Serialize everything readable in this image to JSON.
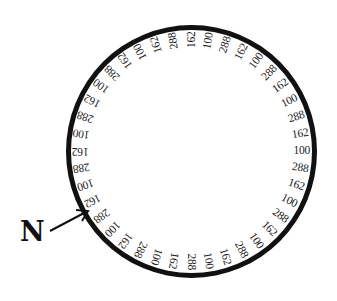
{
  "diagram": {
    "type": "circular-label-ring",
    "ring": {
      "center": [
        191,
        151
      ],
      "label_radius": 111,
      "start_angle_deg": -18,
      "step_deg": 9,
      "stroke_color": "#111111",
      "labels": [
        "162",
        "288",
        "162",
        "100",
        "288",
        "162",
        "100",
        "288",
        "162",
        "100",
        "288",
        "162",
        "100",
        "288",
        "162",
        "100",
        "288",
        "162",
        "100",
        "288",
        "162",
        "100",
        "288",
        "162",
        "100",
        "288",
        "162",
        "100",
        "288",
        "162",
        "100",
        "288",
        "162",
        "100",
        "288",
        "162",
        "100",
        "288",
        "162",
        "100"
      ]
    },
    "pointer": {
      "label": "N",
      "icon": "arrow-icon"
    }
  }
}
